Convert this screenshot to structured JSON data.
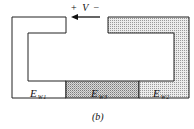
{
  "figure": {
    "caption": "(b)",
    "voltage": {
      "plus": "+",
      "symbol": "V",
      "minus": "−",
      "arrow_direction": "left"
    },
    "regions": [
      {
        "id": "ew1",
        "label_main": "E",
        "label_sub": "W1",
        "fill": "#ffffff"
      },
      {
        "id": "ew3",
        "label_main": "E",
        "label_sub": "W3",
        "fill": "#cfcfcf"
      },
      {
        "id": "ew2",
        "label_main": "E",
        "label_sub": "W2",
        "fill": "#e3e3e3"
      }
    ],
    "colors": {
      "stroke": "#222222",
      "shade_light": "#e3e3e3",
      "shade_dark": "#cfcfcf",
      "background": "#ffffff"
    }
  }
}
